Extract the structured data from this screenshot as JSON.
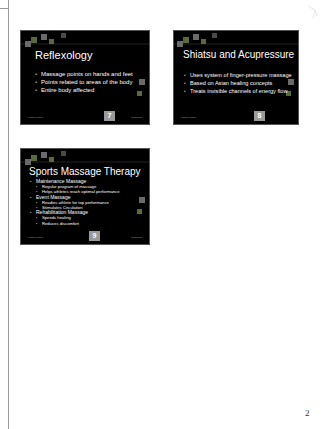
{
  "page": {
    "number": "2"
  },
  "slides": [
    {
      "title": "Reflexology",
      "bullets": [
        {
          "text": "Massage points on hands and feet",
          "level": 1
        },
        {
          "text": "Points related to areas of the body",
          "level": 1
        },
        {
          "text": "Entire body affected",
          "level": 1
        }
      ],
      "footer_left": "Ariadne Tonea",
      "footer_right": "1/23/2003",
      "number": "7"
    },
    {
      "title": "Shiatsu and Acupressure",
      "bullets": [
        {
          "text": "Uses system of finger-pressure massage",
          "level": 1
        },
        {
          "text": "Based on Asian healing concepts",
          "level": 1
        },
        {
          "text": "Treats invisible channels of energy flow",
          "level": 1
        }
      ],
      "footer_left": "Ariadne Tonea",
      "footer_right": "",
      "number": "8"
    },
    {
      "title": "Sports Massage Therapy",
      "bullets": [
        {
          "text": "Maintenance Massage",
          "level": 1
        },
        {
          "text": "Regular program of massage",
          "level": 2
        },
        {
          "text": "Helps athletes reach optimal performance",
          "level": 2
        },
        {
          "text": "Event Massage",
          "level": 1
        },
        {
          "text": "Readies athlete for top performance",
          "level": 2
        },
        {
          "text": "Stimulates Circulation",
          "level": 2
        },
        {
          "text": "Rehabilitation Massage",
          "level": 1
        },
        {
          "text": "Speeds healing",
          "level": 2
        },
        {
          "text": "Reduces discomfort",
          "level": 2
        }
      ],
      "footer_left": "Ariadne Tonea",
      "footer_right": "1/23/2003",
      "number": "9"
    }
  ],
  "colors": {
    "slide_bg": "#000000",
    "slide_text": "#ffffff",
    "bullet": "#8a9a60",
    "deco_green": "#5a6a3a",
    "deco_gray": "#6a6a6a",
    "number_box": "#9a9a9a"
  }
}
